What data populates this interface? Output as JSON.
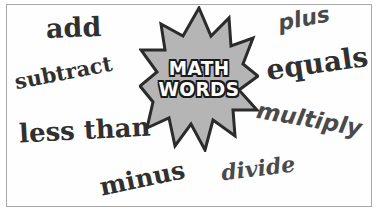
{
  "graphic": {
    "kind": "math-vocabulary-word-cloud",
    "frame_color": "#a9a9a9",
    "background_color": "#ffffff"
  },
  "starburst": {
    "name": "starburst-badge",
    "fill_color": "#b5b5b5",
    "outline_color": "#2b2b2b",
    "points": 12,
    "label_line1": "MATH",
    "label_line2": "WORDS",
    "label_fill_color": "#ffffff",
    "label_outline_color": "#1a1a1a"
  },
  "words": [
    {
      "id": "add",
      "text": "add",
      "color": "#303030"
    },
    {
      "id": "subtract",
      "text": "subtract",
      "color": "#303030"
    },
    {
      "id": "less-than",
      "text": "less than",
      "color": "#303030"
    },
    {
      "id": "minus",
      "text": "minus",
      "color": "#303030"
    },
    {
      "id": "plus",
      "text": "plus",
      "color": "#4a4a4a"
    },
    {
      "id": "equals",
      "text": "equals",
      "color": "#303030"
    },
    {
      "id": "multiply",
      "text": "multiply",
      "color": "#4a4a4a"
    },
    {
      "id": "divide",
      "text": "divide",
      "color": "#4a4a4a"
    }
  ]
}
